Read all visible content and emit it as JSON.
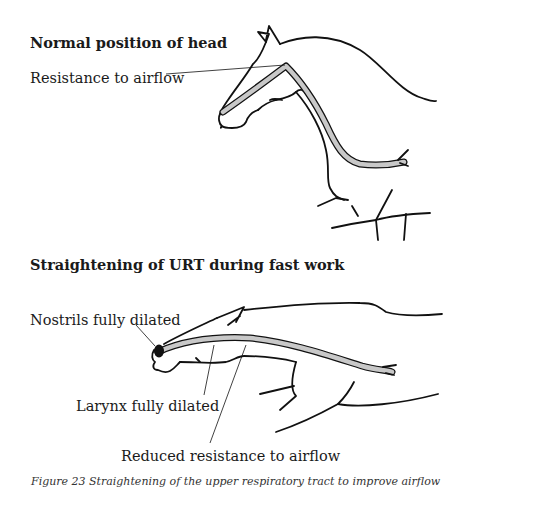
{
  "figure": {
    "caption": "Figure 23  Straightening of the upper respiratory tract to improve airflow",
    "colors": {
      "outline": "#111111",
      "airway_fill": "#c8c8c8",
      "nostril": "#111111",
      "background": "#ffffff"
    }
  },
  "panels": [
    {
      "heading": "Normal position of head",
      "labels": [
        {
          "text": "Resistance to airflow"
        }
      ]
    },
    {
      "heading": "Straightening of URT during fast work",
      "labels": [
        {
          "text": "Nostrils fully dilated"
        },
        {
          "text": "Larynx fully dilated"
        },
        {
          "text": "Reduced resistance to airflow"
        }
      ]
    }
  ]
}
